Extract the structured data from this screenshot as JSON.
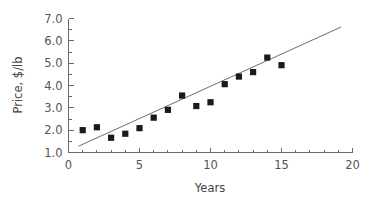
{
  "chart_data": {
    "type": "scatter",
    "title": "",
    "xlabel": "Years",
    "ylabel": "Price, $/lb",
    "xlim": [
      0,
      20
    ],
    "ylim": [
      1.0,
      7.0
    ],
    "grid": false,
    "legend": "none",
    "x_ticks_major": [
      0,
      5,
      10,
      15,
      20
    ],
    "x_tick_labels": [
      "0",
      "5",
      "10",
      "15",
      "20"
    ],
    "x_ticks_minor": [
      1,
      2,
      3,
      4,
      6,
      7,
      8,
      9,
      11,
      12,
      13,
      14,
      16,
      17,
      18,
      19
    ],
    "y_ticks_major": [
      1.0,
      2.0,
      3.0,
      4.0,
      5.0,
      6.0,
      7.0
    ],
    "y_tick_labels": [
      "1.0",
      "2.0",
      "3.0",
      "4.0",
      "5.0",
      "6.0",
      "7.0"
    ],
    "y_ticks_minor": [
      1.5,
      2.5,
      3.5,
      4.5,
      5.5,
      6.5
    ],
    "marker": "filled-square",
    "marker_color": "#1a1a1a",
    "x": [
      1,
      2,
      3,
      4,
      5,
      6,
      7,
      8,
      9,
      10,
      11,
      12,
      13,
      14,
      15
    ],
    "y": [
      2.0,
      2.13,
      1.66,
      1.84,
      2.09,
      2.56,
      2.91,
      3.55,
      3.08,
      3.25,
      4.06,
      4.4,
      4.6,
      5.25,
      4.91
    ],
    "series": [
      {
        "name": "Price observations",
        "type": "scatter",
        "values": [
          2.0,
          2.13,
          1.66,
          1.84,
          2.09,
          2.56,
          2.91,
          3.55,
          3.08,
          3.25,
          4.06,
          4.4,
          4.6,
          5.25,
          4.91
        ]
      },
      {
        "name": "Linear fit",
        "type": "line",
        "color": "#6e6e6e",
        "endpoints": [
          [
            0.7,
            1.28
          ],
          [
            19.2,
            6.62
          ]
        ]
      }
    ],
    "trendline": {
      "x_start": 0.7,
      "y_start": 1.28,
      "x_end": 19.2,
      "y_end": 6.62
    },
    "axis_color": "#6b6b6b",
    "background_color": "#ffffff"
  }
}
